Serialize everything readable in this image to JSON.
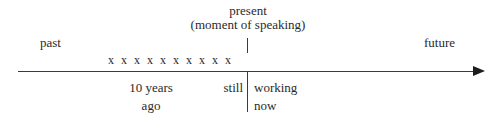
{
  "diagram": {
    "axis": {
      "direction_icon": "right-arrow-icon",
      "left_label": "past",
      "right_label": "future"
    },
    "present_marker": {
      "label_line1": "present",
      "label_line2": "(moment of speaking)",
      "tick_icon": "vertical-tick-icon",
      "divider_icon": "vertical-divider-icon"
    },
    "occurrence_marks": {
      "glyph": "x",
      "count": 10,
      "marks": [
        "x",
        "x",
        "x",
        "x",
        "x",
        "x",
        "x",
        "x",
        "x",
        "x"
      ]
    },
    "annotations": {
      "duration_line1": "10 years",
      "duration_line2": "ago",
      "before_marker": "still",
      "after_marker_line1": "working",
      "after_marker_line2": "now"
    },
    "colors": {
      "background": "#ffffff",
      "text": "#2a2a2a",
      "line": "#3a3a3a",
      "arrowhead": "#1d1d1d"
    }
  }
}
